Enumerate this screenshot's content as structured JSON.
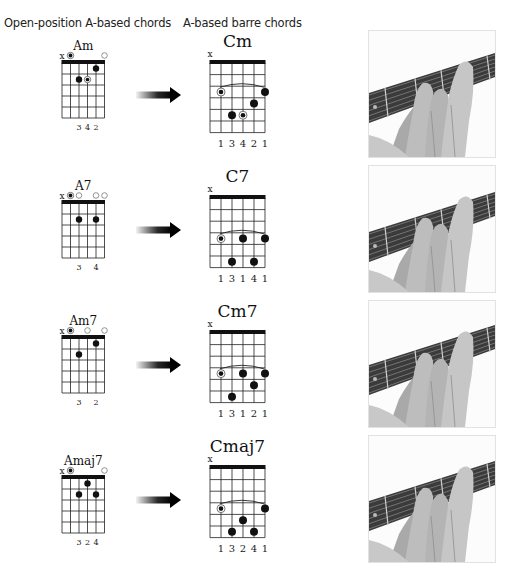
{
  "headings": {
    "left": "Open-position A-based chords",
    "right": "A-based barre chords"
  },
  "colors": {
    "ink": "#111111",
    "muted_string": "#888888",
    "fretboard": "#3a3a3a",
    "skin": "#bdbdbd"
  },
  "rows": [
    {
      "open_chord": {
        "name": "Am",
        "markers": [
          "x",
          "root",
          "",
          "",
          "",
          "open"
        ],
        "dots": [
          {
            "string": 4,
            "fret": 1,
            "type": "dot"
          },
          {
            "string": 2,
            "fret": 2,
            "type": "dot"
          },
          {
            "string": 3,
            "fret": 2,
            "type": "root"
          }
        ],
        "fingers": [
          "",
          "",
          "3",
          "4",
          "2",
          ""
        ]
      },
      "barre_chord": {
        "name": "Cm",
        "markers": [
          "x",
          "",
          "",
          "",
          "",
          ""
        ],
        "barre": {
          "fret": 3,
          "from": 1,
          "to": 5
        },
        "dots": [
          {
            "string": 1,
            "fret": 3,
            "type": "root"
          },
          {
            "string": 5,
            "fret": 3,
            "type": "dot"
          },
          {
            "string": 4,
            "fret": 4,
            "type": "dot"
          },
          {
            "string": 2,
            "fret": 5,
            "type": "dot"
          },
          {
            "string": 3,
            "fret": 5,
            "type": "root"
          }
        ],
        "fingers": [
          "",
          "1",
          "3",
          "4",
          "2",
          "1"
        ]
      },
      "photo": "hand-fretting-Cm"
    },
    {
      "open_chord": {
        "name": "A7",
        "markers": [
          "x",
          "root",
          "open",
          "",
          "open",
          "open"
        ],
        "dots": [
          {
            "string": 2,
            "fret": 2,
            "type": "dot"
          },
          {
            "string": 4,
            "fret": 2,
            "type": "dot"
          }
        ],
        "fingers": [
          "",
          "",
          "3",
          "",
          "4",
          ""
        ]
      },
      "barre_chord": {
        "name": "C7",
        "markers": [
          "x",
          "",
          "",
          "",
          "",
          ""
        ],
        "barre": {
          "fret": 4,
          "from": 1,
          "to": 5
        },
        "dots": [
          {
            "string": 1,
            "fret": 4,
            "type": "root"
          },
          {
            "string": 3,
            "fret": 4,
            "type": "dot"
          },
          {
            "string": 5,
            "fret": 4,
            "type": "dot"
          },
          {
            "string": 2,
            "fret": 6,
            "type": "dot"
          },
          {
            "string": 4,
            "fret": 6,
            "type": "dot"
          }
        ],
        "fingers": [
          "",
          "1",
          "3",
          "1",
          "4",
          "1"
        ]
      },
      "photo": "hand-fretting-C7"
    },
    {
      "open_chord": {
        "name": "Am7",
        "markers": [
          "x",
          "root",
          "",
          "open",
          "",
          "open"
        ],
        "dots": [
          {
            "string": 4,
            "fret": 1,
            "type": "dot"
          },
          {
            "string": 2,
            "fret": 2,
            "type": "dot"
          }
        ],
        "fingers": [
          "",
          "",
          "3",
          "",
          "2",
          ""
        ]
      },
      "barre_chord": {
        "name": "Cm7",
        "markers": [
          "x",
          "",
          "",
          "",
          "",
          ""
        ],
        "barre": {
          "fret": 4,
          "from": 1,
          "to": 5
        },
        "dots": [
          {
            "string": 1,
            "fret": 4,
            "type": "root"
          },
          {
            "string": 3,
            "fret": 4,
            "type": "dot"
          },
          {
            "string": 5,
            "fret": 4,
            "type": "dot"
          },
          {
            "string": 4,
            "fret": 5,
            "type": "dot"
          },
          {
            "string": 2,
            "fret": 6,
            "type": "dot"
          }
        ],
        "fingers": [
          "",
          "1",
          "3",
          "1",
          "2",
          "1"
        ]
      },
      "photo": "hand-fretting-Cm7"
    },
    {
      "open_chord": {
        "name": "Amaj7",
        "markers": [
          "x",
          "root",
          "",
          "",
          "",
          "open"
        ],
        "dots": [
          {
            "string": 3,
            "fret": 1,
            "type": "dot"
          },
          {
            "string": 2,
            "fret": 2,
            "type": "dot"
          },
          {
            "string": 4,
            "fret": 2,
            "type": "dot"
          }
        ],
        "fingers": [
          "",
          "",
          "3",
          "2",
          "4",
          ""
        ]
      },
      "barre_chord": {
        "name": "Cmaj7",
        "markers": [
          "x",
          "",
          "",
          "",
          "",
          ""
        ],
        "barre": {
          "fret": 4,
          "from": 1,
          "to": 5
        },
        "dots": [
          {
            "string": 1,
            "fret": 4,
            "type": "root"
          },
          {
            "string": 5,
            "fret": 4,
            "type": "dot"
          },
          {
            "string": 3,
            "fret": 5,
            "type": "dot"
          },
          {
            "string": 2,
            "fret": 6,
            "type": "dot"
          },
          {
            "string": 4,
            "fret": 6,
            "type": "dot"
          }
        ],
        "fingers": [
          "",
          "1",
          "3",
          "2",
          "4",
          "1"
        ]
      },
      "photo": "hand-fretting-Cmaj7"
    }
  ]
}
